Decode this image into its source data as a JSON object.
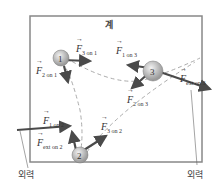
{
  "header": {
    "faded_text": ""
  },
  "system": {
    "label": "계"
  },
  "particles": [
    {
      "id": "1",
      "label": "1"
    },
    {
      "id": "2",
      "label": "2"
    },
    {
      "id": "3",
      "label": "3"
    }
  ],
  "forces": {
    "f3on1": {
      "sym": "F",
      "sub": "3 on 1"
    },
    "f2on1": {
      "sym": "F",
      "sub": "2 on 1"
    },
    "f1on3": {
      "sym": "F",
      "sub": "1 on 3"
    },
    "f2on3": {
      "sym": "F",
      "sub": "2 on 3"
    },
    "f1on2": {
      "sym": "F",
      "sub": "1 on 2"
    },
    "f3on2": {
      "sym": "F",
      "sub": "3 on 2"
    },
    "fexton2": {
      "sym": "F",
      "sub": "ext on 2"
    },
    "fexton3": {
      "sym": "F",
      "sub": "ext on 3"
    }
  },
  "external_labels": {
    "left": "외력",
    "right": "외력"
  }
}
